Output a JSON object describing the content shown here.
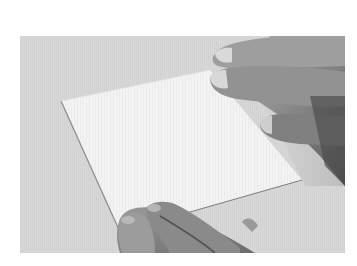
{
  "image": {
    "description": "Photograph of two hands holding a blank white card against a light grey textured surface",
    "watermark_text": "",
    "colors": {
      "page_background": "#ffffff",
      "surface": "#d8d8d8",
      "card": "#f2f2f2",
      "card_edge_shadow": "#8a8a8a",
      "hand_light": "#b4b4b4",
      "hand_mid": "#8e8e8e",
      "hand_dark": "#5a5a5a",
      "fingernail": "#dcdcdc"
    }
  }
}
